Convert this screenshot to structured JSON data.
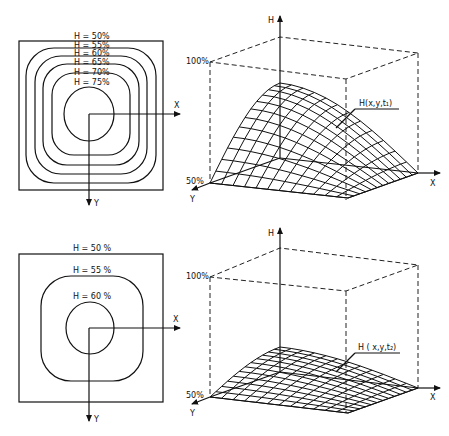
{
  "figure": {
    "top_contour": {
      "x_axis_label": "X",
      "y_axis_label": "Y",
      "contours": [
        {
          "label": "H = 50%",
          "value": 50
        },
        {
          "label": "H = 55%",
          "value": 55
        },
        {
          "label": "H = 60%",
          "value": 60
        },
        {
          "label": "H = 65%",
          "value": 65
        },
        {
          "label": "H = 70%",
          "value": 70
        },
        {
          "label": "H = 75%",
          "value": 75
        }
      ]
    },
    "top_surface": {
      "h_axis_label": "H",
      "x_axis_label": "X",
      "y_axis_label": "Y",
      "top_level_label": "100%",
      "base_level_label": "50%",
      "surface_label": "H(x,y,t₁)"
    },
    "bottom_contour": {
      "x_axis_label": "X",
      "y_axis_label": "Y",
      "contours": [
        {
          "label": "H = 50 %",
          "value": 50
        },
        {
          "label": "H = 55 %",
          "value": 55
        },
        {
          "label": "H = 60 %",
          "value": 60
        }
      ]
    },
    "bottom_surface": {
      "h_axis_label": "H",
      "x_axis_label": "X",
      "y_axis_label": "Y",
      "top_level_label": "100%",
      "base_level_label": "50%",
      "surface_label": "H ( x,y,t₂)"
    }
  }
}
